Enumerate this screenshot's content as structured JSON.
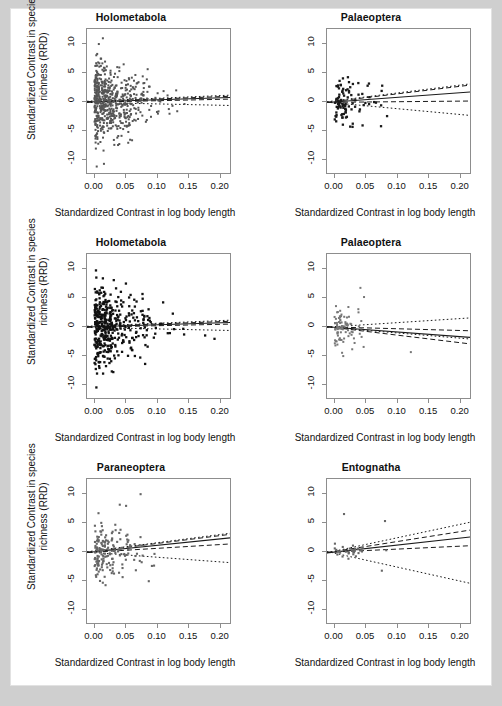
{
  "figure": {
    "background": "#cfcfcf",
    "panel_background": "#ffffff",
    "axis_color": "#8d8d8d",
    "xlabel": "Standardized Contrast in log body length",
    "ylabel_line1": "Standardized Contrast in species",
    "ylabel_line2": "richness (RRD)",
    "xticks": [
      "0.00",
      "0.05",
      "0.10",
      "0.15",
      "0.20"
    ],
    "yticks": [
      "-10",
      "-5",
      "0",
      "5",
      "10"
    ]
  },
  "chart_data": [
    {
      "type": "scatter",
      "panel_index": 0,
      "position": "top-left",
      "title": "Holometabola",
      "xlabel": "Standardized Contrast in log body length",
      "ylabel": "Standardized Contrast in species richness (RRD)",
      "xlim": [
        -0.012,
        0.218
      ],
      "ylim": [
        -12.5,
        12.5
      ],
      "xticks": [
        0.0,
        0.05,
        0.1,
        0.15,
        0.2
      ],
      "yticks": [
        -10,
        -5,
        0,
        5,
        10
      ],
      "grid": false,
      "point_color": "#555555",
      "point_size": 2.0,
      "n_points": 560,
      "point_distribution": {
        "x": "right-skewed exponential, dense near 0, tail to 0.21",
        "y": "symmetric about 0, sd decreasing with x"
      },
      "lines": [
        {
          "name": "regression",
          "style": "solid",
          "intercept": 0.05,
          "slope": 3.3
        },
        {
          "name": "upper-confidence",
          "style": "dashed",
          "intercept": 0.12,
          "slope": 4.0
        },
        {
          "name": "lower-confidence",
          "style": "dashed",
          "intercept": -0.02,
          "slope": 2.4
        },
        {
          "name": "upper-prediction",
          "style": "dotted",
          "intercept": 0.18,
          "slope": 4.6
        },
        {
          "name": "lower-prediction",
          "style": "dotted",
          "intercept": -0.1,
          "slope": -2.3
        }
      ]
    },
    {
      "type": "scatter",
      "panel_index": 1,
      "position": "top-right",
      "title": "Palaeoptera",
      "xlabel": "Standardized Contrast in log body length",
      "ylabel": "Standardized Contrast in species richness (RRD)",
      "xlim": [
        -0.012,
        0.218
      ],
      "ylim": [
        -12.5,
        12.5
      ],
      "xticks": [
        0.0,
        0.05,
        0.1,
        0.15,
        0.2
      ],
      "yticks": [
        -10,
        -5,
        0,
        5,
        10
      ],
      "grid": false,
      "point_color": "#1a1a1a",
      "point_size": 2.3,
      "n_points": 96,
      "point_distribution": {
        "x": "concentrated 0 to 0.09, few to 0.10",
        "y": "spread -5 to 6"
      },
      "lines": [
        {
          "name": "regression",
          "style": "solid",
          "intercept": 0.0,
          "slope": 8.0
        },
        {
          "name": "upper-confidence",
          "style": "dashed",
          "intercept": 0.1,
          "slope": 13.0
        },
        {
          "name": "lower-confidence",
          "style": "dashed",
          "intercept": -0.05,
          "slope": 1.0
        },
        {
          "name": "upper-prediction",
          "style": "dotted",
          "intercept": 0.2,
          "slope": 13.5
        },
        {
          "name": "lower-prediction",
          "style": "dotted",
          "intercept": -0.15,
          "slope": -10.0
        }
      ]
    },
    {
      "type": "scatter",
      "panel_index": 2,
      "position": "middle-left",
      "title": "Holometabola",
      "xlabel": "Standardized Contrast in log body length",
      "ylabel": "Standardized Contrast in species richness (RRD)",
      "xlim": [
        -0.012,
        0.218
      ],
      "ylim": [
        -12.5,
        12.5
      ],
      "xticks": [
        0.0,
        0.05,
        0.1,
        0.15,
        0.2
      ],
      "yticks": [
        -10,
        -5,
        0,
        5,
        10
      ],
      "grid": false,
      "point_color": "#111111",
      "point_size": 2.3,
      "n_points": 420,
      "point_distribution": {
        "x": "right-skewed exponential, dense near 0, tail to 0.21",
        "y": "symmetric about 0, sd decreasing with x"
      },
      "lines": [
        {
          "name": "regression",
          "style": "solid",
          "intercept": 0.05,
          "slope": 3.3
        },
        {
          "name": "upper-confidence",
          "style": "dashed",
          "intercept": 0.12,
          "slope": 4.0
        },
        {
          "name": "lower-confidence",
          "style": "dashed",
          "intercept": -0.02,
          "slope": 2.4
        },
        {
          "name": "upper-prediction",
          "style": "dotted",
          "intercept": 0.18,
          "slope": 4.6
        },
        {
          "name": "lower-prediction",
          "style": "dotted",
          "intercept": -0.1,
          "slope": -2.3
        }
      ]
    },
    {
      "type": "scatter",
      "panel_index": 3,
      "position": "middle-right",
      "title": "Palaeoptera",
      "xlabel": "Standardized Contrast in log body length",
      "ylabel": "Standardized Contrast in species richness (RRD)",
      "xlim": [
        -0.012,
        0.218
      ],
      "ylim": [
        -12.5,
        12.5
      ],
      "xticks": [
        0.0,
        0.05,
        0.1,
        0.15,
        0.2
      ],
      "yticks": [
        -10,
        -5,
        0,
        5,
        10
      ],
      "grid": false,
      "point_color": "#777777",
      "point_size": 2.0,
      "n_points": 88,
      "point_distribution": {
        "x": "concentrated 0 to 0.05, one outlier at 0.12",
        "y": "spread -5 to 7"
      },
      "lines": [
        {
          "name": "regression",
          "style": "solid",
          "intercept": -0.05,
          "slope": -8.0
        },
        {
          "name": "upper-confidence",
          "style": "dashed",
          "intercept": 0.0,
          "slope": -3.0
        },
        {
          "name": "lower-confidence",
          "style": "dashed",
          "intercept": -0.1,
          "slope": -13.0
        },
        {
          "name": "upper-prediction",
          "style": "dotted",
          "intercept": 0.05,
          "slope": 7.0
        },
        {
          "name": "lower-prediction",
          "style": "dotted",
          "intercept": -0.12,
          "slope": -9.0
        }
      ]
    },
    {
      "type": "scatter",
      "panel_index": 4,
      "position": "bottom-left",
      "title": "Paraneoptera",
      "xlabel": "Standardized Contrast in log body length",
      "ylabel": "Standardized Contrast in species richness (RRD)",
      "xlim": [
        -0.012,
        0.218
      ],
      "ylim": [
        -12.5,
        12.5
      ],
      "xticks": [
        0.0,
        0.05,
        0.1,
        0.15,
        0.2
      ],
      "yticks": [
        -10,
        -5,
        0,
        5,
        10
      ],
      "grid": false,
      "point_color": "#666666",
      "point_size": 2.1,
      "n_points": 170,
      "point_distribution": {
        "x": "concentrated 0 to 0.09, few to 0.11",
        "y": "spread -5 to 10"
      },
      "lines": [
        {
          "name": "regression",
          "style": "solid",
          "intercept": 0.05,
          "slope": 11.0
        },
        {
          "name": "upper-confidence",
          "style": "dashed",
          "intercept": 0.12,
          "slope": 13.5
        },
        {
          "name": "lower-confidence",
          "style": "dashed",
          "intercept": -0.02,
          "slope": 6.5
        },
        {
          "name": "upper-prediction",
          "style": "dotted",
          "intercept": 0.2,
          "slope": 14.0
        },
        {
          "name": "lower-prediction",
          "style": "dotted",
          "intercept": -0.1,
          "slope": -8.0
        }
      ]
    },
    {
      "type": "scatter",
      "panel_index": 5,
      "position": "bottom-right",
      "title": "Entognatha",
      "xlabel": "Standardized Contrast in log body length",
      "ylabel": "Standardized Contrast in species richness (RRD)",
      "xlim": [
        -0.012,
        0.218
      ],
      "ylim": [
        -12.5,
        12.5
      ],
      "xticks": [
        0.0,
        0.05,
        0.1,
        0.15,
        0.2
      ],
      "yticks": [
        -10,
        -5,
        0,
        5,
        10
      ],
      "grid": false,
      "point_color": "#666666",
      "point_size": 2.1,
      "n_points": 34,
      "point_distribution": {
        "x": "tight cluster 0 to 0.05, outliers at 0.015, 0.075, 0.08",
        "y": "mostly near 0, outliers at 6.5, 5.3, -3.2"
      },
      "lines": [
        {
          "name": "regression",
          "style": "solid",
          "intercept": 0.0,
          "slope": 12.0
        },
        {
          "name": "upper-confidence",
          "style": "dashed",
          "intercept": 0.1,
          "slope": 17.0
        },
        {
          "name": "lower-confidence",
          "style": "dashed",
          "intercept": 0.0,
          "slope": 5.0
        },
        {
          "name": "upper-prediction",
          "style": "dotted",
          "intercept": 0.15,
          "slope": 23.0
        },
        {
          "name": "lower-prediction",
          "style": "dotted",
          "intercept": -0.2,
          "slope": -24.0
        }
      ]
    }
  ]
}
